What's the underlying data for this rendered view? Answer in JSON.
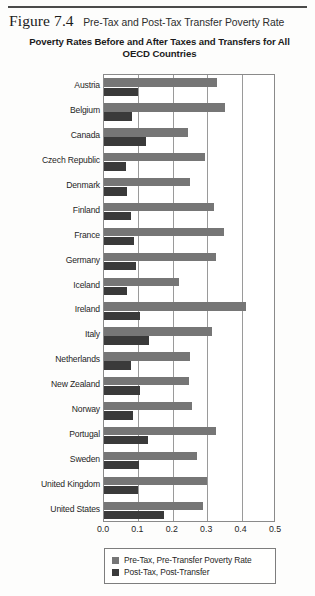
{
  "figure": {
    "number": "Figure 7.4",
    "caption": "Pre-Tax and Post-Tax Transfer Poverty Rate"
  },
  "legend": {
    "position": "bottom-center",
    "items": [
      {
        "label": "Pre-Tax, Pre-Transfer Poverty Rate",
        "color": "#767676"
      },
      {
        "label": "Post-Tax, Post-Transfer",
        "color": "#3a3a3a"
      }
    ]
  },
  "colors": {
    "pre_tax": "#767676",
    "post_tax": "#3a3a3a",
    "axis": "#8a8a8a",
    "grid": "#9a9a9a",
    "text": "#1f1f1f"
  },
  "chart_data": {
    "type": "bar",
    "orientation": "horizontal",
    "title": "Poverty Rates Before and After Taxes and Transfers for All OECD Countries",
    "subtitle": "",
    "xlabel": "",
    "ylabel": "",
    "xlim": [
      0.0,
      0.5
    ],
    "xticks": [
      "0.0",
      "0.1",
      "0.2",
      "0.3",
      "0.4",
      "0.5"
    ],
    "xtick_values": [
      0.0,
      0.1,
      0.2,
      0.3,
      0.4,
      0.5
    ],
    "grid": true,
    "grid_axis": "x",
    "legend_position": "bottom",
    "categories": [
      "Austria",
      "Belgium",
      "Canada",
      "Czech Republic",
      "Denmark",
      "Finland",
      "France",
      "Germany",
      "Iceland",
      "Ireland",
      "Italy",
      "Netherlands",
      "New Zealand",
      "Norway",
      "Portugal",
      "Sweden",
      "United Kingdom",
      "United States"
    ],
    "series": [
      {
        "name": "Pre-Tax, Pre-Transfer Poverty Rate",
        "color": "#767676",
        "values": [
          0.328,
          0.352,
          0.243,
          0.293,
          0.25,
          0.32,
          0.35,
          0.327,
          0.217,
          0.414,
          0.315,
          0.25,
          0.247,
          0.255,
          0.327,
          0.27,
          0.3,
          0.287
        ]
      },
      {
        "name": "Post-Tax, Post-Transfer",
        "color": "#3a3a3a",
        "values": [
          0.1,
          0.08,
          0.122,
          0.064,
          0.068,
          0.078,
          0.086,
          0.093,
          0.066,
          0.104,
          0.13,
          0.078,
          0.105,
          0.084,
          0.127,
          0.102,
          0.1,
          0.175
        ]
      }
    ]
  }
}
